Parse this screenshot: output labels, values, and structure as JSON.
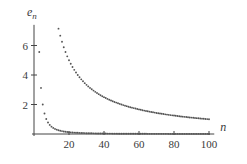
{
  "chart_data": {
    "type": "scatter",
    "title": "",
    "xlabel": "n",
    "ylabel": "e_n",
    "ylabel_main": "e",
    "ylabel_sub": "n",
    "xlim": [
      0,
      105
    ],
    "ylim": [
      0,
      7.5
    ],
    "x_ticks": [
      20,
      40,
      60,
      80,
      100
    ],
    "x_tick_labels": [
      "20",
      "40",
      "60",
      "80",
      "100"
    ],
    "y_ticks": [
      2,
      4,
      6
    ],
    "y_tick_labels": [
      "2",
      "4",
      "6"
    ],
    "grid": false,
    "legend": null,
    "series": [
      {
        "name": "slow-decay",
        "description": "approximately e_n = 100/n for n = 14..100",
        "x_start": 14,
        "x_end": 100,
        "formula_coefficient": 100,
        "formula_power": 1
      },
      {
        "name": "fast-decay",
        "description": "approximately e_n = 50/n^2 for n = 3..100",
        "x_start": 3,
        "x_end": 100,
        "formula_coefficient": 50,
        "formula_power": 2
      }
    ],
    "point_color": "#555555"
  }
}
